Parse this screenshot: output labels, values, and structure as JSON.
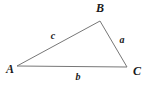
{
  "figure": {
    "type": "geometry-diagram",
    "shape": "triangle",
    "background_color": "#ffffff",
    "stroke_color": "#777777",
    "stroke_width": 1,
    "label_color": "#1a1a1a",
    "width": 150,
    "height": 85
  },
  "vertices": [
    {
      "id": "A",
      "label": "A",
      "point_x": 17,
      "point_y": 66,
      "label_x": 10,
      "label_y": 69
    },
    {
      "id": "B",
      "label": "B",
      "point_x": 100,
      "point_y": 21,
      "label_x": 100,
      "label_y": 8
    },
    {
      "id": "C",
      "label": "C",
      "point_x": 127,
      "point_y": 67,
      "label_x": 137,
      "label_y": 71
    }
  ],
  "sides": [
    {
      "id": "a",
      "label": "a",
      "from": "B",
      "to": "C",
      "label_x": 122,
      "label_y": 40
    },
    {
      "id": "b",
      "label": "b",
      "from": "A",
      "to": "C",
      "label_x": 78,
      "label_y": 77
    },
    {
      "id": "c",
      "label": "c",
      "from": "A",
      "to": "B",
      "label_x": 53,
      "label_y": 36
    }
  ],
  "polygon_points": "17,66 100,21 127,67"
}
